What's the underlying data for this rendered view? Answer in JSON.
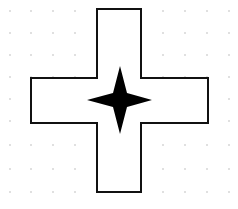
{
  "diagram": {
    "background": "#ffffff",
    "grid": {
      "type": "dot-grid",
      "dot_color": "#b8b8b8",
      "x": [
        10,
        31,
        53,
        75,
        97,
        119,
        141,
        163,
        185,
        207,
        229
      ],
      "y": [
        11,
        33,
        55,
        77,
        99,
        121,
        145,
        169,
        192
      ]
    },
    "cross": {
      "shape": "plus-outline",
      "stroke": "#111111",
      "fill": "#ffffff",
      "stroke_width": 2,
      "points": "97,9 141,9 141,78 208,78 208,123 141,123 141,192 97,192 97,123 31,123 31,78 97,78"
    },
    "star": {
      "shape": "four-pointed-star",
      "fill": "#000000",
      "center": [
        120,
        100
      ],
      "points": "120,66 127,93 152,100 127,107 120,134 113,107 87,100 113,93"
    }
  }
}
